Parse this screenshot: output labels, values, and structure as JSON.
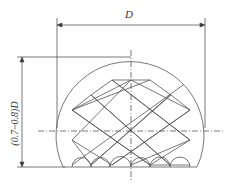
{
  "diagram": {
    "type": "technical-drawing",
    "labels": {
      "width_dim": "D",
      "height_dim": "(0.7~0.8)D"
    },
    "colors": {
      "line": "#555555",
      "background": "#ffffff"
    }
  }
}
